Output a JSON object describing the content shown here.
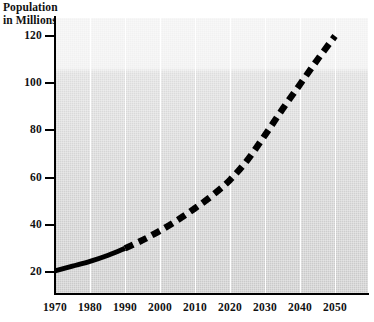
{
  "chart_data": {
    "type": "line",
    "title": "",
    "ylabel": "Population\nin Millions",
    "xlabel": "",
    "xlim": [
      1970,
      2055
    ],
    "ylim": [
      14,
      128
    ],
    "grid": "vertical-white-gridlines",
    "legend": "none",
    "x_ticks": [
      "1970",
      "1980",
      "1990",
      "2000",
      "2010",
      "2020",
      "2030",
      "2040",
      "2050"
    ],
    "y_ticks": [
      "20",
      "40",
      "60",
      "80",
      "100",
      "120"
    ],
    "x": [
      1970,
      1980,
      1990,
      2000,
      2010,
      2020,
      2030,
      2040,
      2050
    ],
    "series": [
      {
        "name": "Historical population",
        "style": "solid",
        "x": [
          1970,
          1975,
          1980,
          1985,
          1990
        ],
        "values": [
          20.5,
          22.5,
          24.5,
          27.0,
          30.0
        ]
      },
      {
        "name": "Projected population",
        "style": "dashed",
        "x": [
          1990,
          1995,
          2000,
          2005,
          2010,
          2015,
          2020,
          2025,
          2030,
          2035,
          2040,
          2045,
          2050
        ],
        "values": [
          30.0,
          33.5,
          37.5,
          42.0,
          47.0,
          52.5,
          59.0,
          67.5,
          78.0,
          89.0,
          99.5,
          110.0,
          120.0
        ]
      }
    ]
  },
  "axis": {
    "title_line1": "Population",
    "title_line2": "in Millions"
  },
  "colors": {
    "line": "#000000",
    "gridline": "#ffffff",
    "axis": "#000000",
    "plot_bg_top": "#f2f2f2",
    "plot_bg_bottom": "#c9c9c9",
    "text": "#111111"
  }
}
